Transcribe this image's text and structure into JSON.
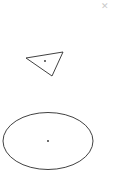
{
  "canvas": {
    "width": 127,
    "height": 179,
    "background_color": "#ffffff",
    "stroke_color": "#2b2b2b",
    "stroke_width": 0.9,
    "fill": "none"
  },
  "toolbar": {
    "close_glyph": "✕",
    "close_label": "close",
    "close_color": "#c9c9c9"
  },
  "shapes": [
    {
      "name": "triangle",
      "type": "polygon",
      "points": "26,58 63,52 52,76",
      "vertices": [
        {
          "x": 26,
          "y": 58
        },
        {
          "x": 63,
          "y": 52
        },
        {
          "x": 52,
          "y": 76
        }
      ],
      "center": {
        "x": 45,
        "y": 61
      },
      "center_dot_radius": 0.9,
      "stroke_color": "#2b2b2b",
      "stroke_width": 0.9,
      "fill": "none"
    },
    {
      "name": "ellipse",
      "type": "ellipse",
      "center": {
        "x": 48,
        "y": 141
      },
      "radius_x": 45,
      "radius_y": 28.5,
      "bounds": {
        "left": 3,
        "top": 112,
        "right": 93,
        "bottom": 169
      },
      "center_dot_radius": 0.9,
      "stroke_color": "#2b2b2b",
      "stroke_width": 0.9,
      "fill": "none"
    }
  ]
}
